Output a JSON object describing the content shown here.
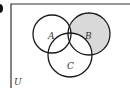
{
  "diagram": {
    "type": "venn",
    "universe_label": "U",
    "sets": [
      {
        "label": "A",
        "cx": 52,
        "cy": 34,
        "r": 19
      },
      {
        "label": "B",
        "cx": 89,
        "cy": 34,
        "r": 21
      },
      {
        "label": "C",
        "cx": 70,
        "cy": 55,
        "r": 22
      }
    ],
    "shaded_region": "B only (B ∩ A' ∩ C')",
    "colors": {
      "stroke": "#1a1a1a",
      "shade": "#d9d9d9",
      "frame": "#333333",
      "background": "#ffffff"
    }
  }
}
